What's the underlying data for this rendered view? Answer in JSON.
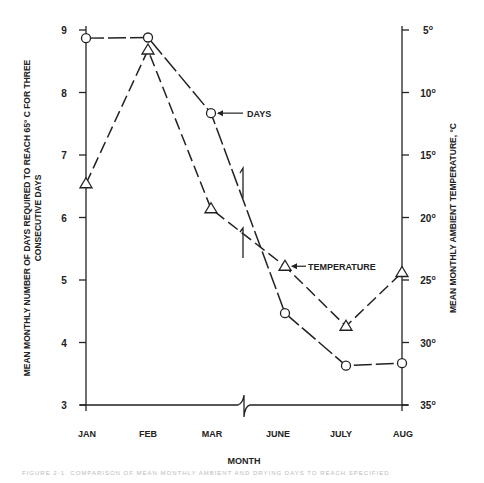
{
  "chart_data": {
    "type": "line",
    "title": "",
    "xlabel": "MONTH",
    "ylabel": "MEAN MONTHLY NUMBER OF DAYS REQUIRED TO REACH 65° C FOR THREE CONSECUTIVE DAYS",
    "y2label": "MEAN MONTHLY AMBIENT TEMPERATURE, °C",
    "categories": [
      "JAN",
      "FEB",
      "MAR",
      "JUNE",
      "JULY",
      "AUG"
    ],
    "ylim": [
      3,
      9
    ],
    "y2lim": [
      5,
      35
    ],
    "y2_inverted": true,
    "y_ticks": [
      "9",
      "8",
      "7",
      "6",
      "5",
      "4",
      "3"
    ],
    "y2_ticks": [
      "5°",
      "10°",
      "15°",
      "20°",
      "25°",
      "30°",
      "35°"
    ],
    "grid": false,
    "series": [
      {
        "name": "DAYS",
        "axis": "left",
        "marker": "circle",
        "values": [
          8.87,
          8.88,
          7.67,
          4.47,
          3.63,
          3.67
        ]
      },
      {
        "name": "TEMPERATURE",
        "axis": "right",
        "marker": "triangle",
        "values": [
          17.3,
          6.6,
          19.3,
          23.9,
          28.7,
          24.4
        ]
      }
    ],
    "annotations": [
      "DAYS",
      "TEMPERATURE"
    ],
    "axis_break": "between MAR and JUNE"
  },
  "labels": {
    "xlabel": "MONTH",
    "ylabel_line1": "MEAN MONTHLY NUMBER OF DAYS REQUIRED TO REACH 65° C FOR THREE",
    "ylabel_line2": "CONSECUTIVE DAYS",
    "y2label": "MEAN MONTHLY AMBIENT TEMPERATURE, °C",
    "days_callout": "DAYS",
    "temp_callout": "TEMPERATURE",
    "caption": "FIGURE 2-1.   COMPARISON OF MEAN MONTHLY AMBIENT AND DRYING DAYS TO REACH SPECIFIED"
  }
}
